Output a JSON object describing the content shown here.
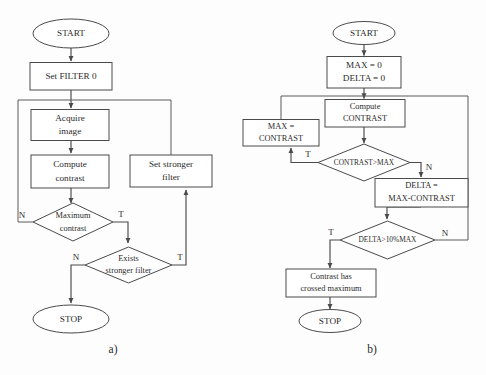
{
  "figure": {
    "background_color": "#fdfdfd",
    "stroke_color": "#4a4a4a",
    "text_color": "#2b2b2b",
    "caption_a": "a)",
    "caption_b": "b)"
  },
  "chart_a": {
    "title": "a)",
    "nodes": {
      "start": "START",
      "set_filter": "Set FILTER 0",
      "acquire_1": "Acquire",
      "acquire_2": "image",
      "compute_1": "Compute",
      "compute_2": "contrast",
      "set_stronger_1": "Set stronger",
      "set_stronger_2": "filter",
      "max_contrast_1": "Maximum",
      "max_contrast_2": "contrast",
      "exists_1": "Exists",
      "exists_2": "stronger filter",
      "stop": "STOP"
    },
    "branch_labels": {
      "max_contrast_false": "N",
      "max_contrast_true": "T",
      "exists_false": "N",
      "exists_true": "T"
    }
  },
  "chart_b": {
    "title": "b)",
    "nodes": {
      "start": "START",
      "init_1": "MAX = 0",
      "init_2": "DELTA = 0",
      "compute_1": "Compute",
      "compute_2": "CONTRAST",
      "assign_max_1": "MAX =",
      "assign_max_2": "CONTRAST",
      "cond_contrast": "CONTRAST>MAX",
      "delta_1": "DELTA =",
      "delta_2": "MAX-CONTRAST",
      "cond_delta": "DELTA>10%MAX",
      "result_1": "Contrast has",
      "result_2": "crossed maximum",
      "stop": "STOP"
    },
    "branch_labels": {
      "contrast_true": "T",
      "contrast_false": "N",
      "delta_true": "T",
      "delta_false": "N"
    }
  }
}
